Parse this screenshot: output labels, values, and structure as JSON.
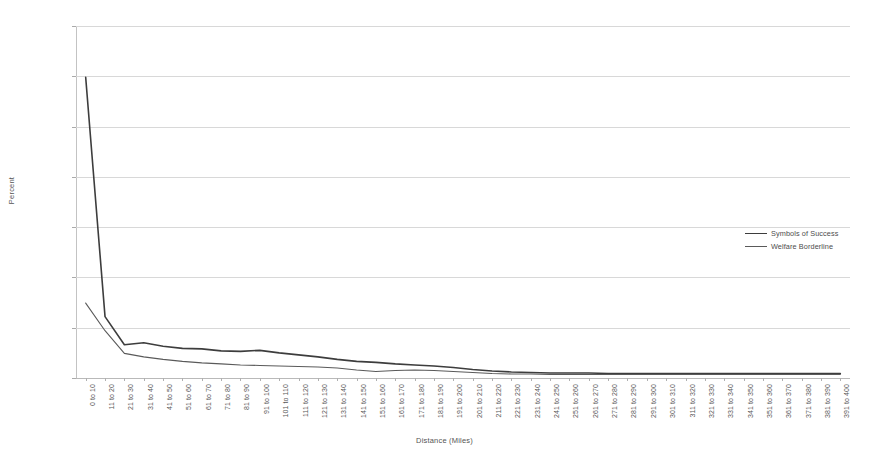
{
  "chart_data": {
    "type": "line",
    "title": "",
    "xlabel": "Distance (Miles)",
    "ylabel": "Percent",
    "ylim": [
      0,
      70
    ],
    "yticks": [
      0,
      10,
      20,
      30,
      40,
      50,
      60,
      70
    ],
    "grid": "horizontal",
    "legend_position": "right",
    "categories": [
      "0 to 10",
      "11 to 20",
      "21 to 30",
      "31 to 40",
      "41 to 50",
      "51 to 60",
      "61 to 70",
      "71 to 80",
      "81 to 90",
      "91 to 100",
      "101 to 110",
      "111 to 120",
      "121 to 130",
      "131 to 140",
      "141 to 150",
      "151 to 160",
      "161 to 170",
      "171 to 180",
      "181 to 190",
      "191 to 200",
      "201 to 210",
      "211 to 220",
      "221 to 230",
      "231 to 240",
      "241 to 250",
      "251 to 260",
      "261 to 270",
      "271 to 280",
      "281 to 290",
      "291 to 300",
      "301 to 310",
      "311 to 320",
      "321 to 330",
      "331 to 340",
      "341 to 350",
      "351 to 360",
      "361 to 370",
      "371 to 380",
      "381 to 390",
      "391 to 400"
    ],
    "series": [
      {
        "name": "Symbols of Success",
        "color": "#3d3d3d",
        "width": 1.6,
        "values": [
          59.8,
          12.2,
          6.6,
          7.0,
          6.3,
          5.9,
          5.8,
          5.4,
          5.3,
          5.5,
          5.0,
          4.6,
          4.2,
          3.7,
          3.3,
          3.1,
          2.8,
          2.6,
          2.4,
          2.1,
          1.7,
          1.4,
          1.2,
          1.1,
          1.0,
          1.0,
          1.0,
          0.9,
          0.9,
          0.9,
          0.9,
          0.9,
          0.9,
          0.9,
          0.9,
          0.9,
          0.9,
          0.9,
          0.9,
          0.9
        ]
      },
      {
        "name": "Welfare Borderline",
        "color": "#5a5a5a",
        "width": 1.1,
        "values": [
          14.9,
          9.4,
          4.9,
          4.2,
          3.7,
          3.3,
          3.0,
          2.8,
          2.6,
          2.5,
          2.4,
          2.3,
          2.2,
          2.0,
          1.6,
          1.3,
          1.5,
          1.6,
          1.5,
          1.3,
          1.1,
          0.9,
          0.8,
          0.8,
          0.7,
          0.7,
          0.7,
          0.7,
          0.7,
          0.7,
          0.7,
          0.7,
          0.7,
          0.7,
          0.7,
          0.7,
          0.7,
          0.7,
          0.7,
          0.7
        ]
      }
    ]
  },
  "axes": {
    "x_title": "Distance (Miles)",
    "y_title": "Percent"
  },
  "legend": {
    "entries": [
      {
        "label": "Symbols of Success"
      },
      {
        "label": "Welfare Borderline"
      }
    ]
  }
}
